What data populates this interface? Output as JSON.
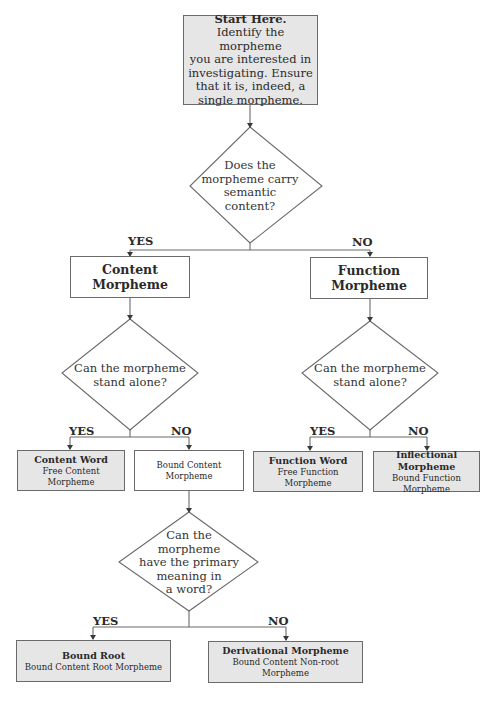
{
  "start": {
    "title": "Start Here.",
    "lines": [
      "Identify the morpheme",
      "you are interested in",
      "investigating. Ensure",
      "that it is, indeed, a",
      "single morpheme."
    ]
  },
  "q1": {
    "lines": [
      "Does the",
      "morpheme carry",
      "semantic",
      "content?"
    ],
    "yes_label": "YES",
    "no_label": "NO"
  },
  "content_morpheme": {
    "title": "Content Morpheme"
  },
  "function_morpheme": {
    "title": "Function Morpheme"
  },
  "q2_content": {
    "lines": [
      "Can the morpheme",
      "stand alone?"
    ],
    "yes_label": "YES",
    "no_label": "NO"
  },
  "q2_function": {
    "lines": [
      "Can the morpheme",
      "stand alone?"
    ],
    "yes_label": "YES",
    "no_label": "NO"
  },
  "content_word": {
    "title": "Content Word",
    "subtitle": "Free Content Morpheme"
  },
  "bound_content": {
    "subtitle": "Bound Content Morpheme"
  },
  "function_word": {
    "title": "Function Word",
    "subtitle": "Free Function Morpheme"
  },
  "inflectional": {
    "title": "Inflectional Morpheme",
    "subtitle": "Bound Function Morpheme"
  },
  "q3": {
    "lines": [
      "Can the",
      "morpheme",
      "have the primary",
      "meaning in",
      "a word?"
    ],
    "yes_label": "YES",
    "no_label": "NO"
  },
  "bound_root": {
    "title": "Bound Root",
    "subtitle": "Bound Content Root Morpheme"
  },
  "derivational": {
    "title": "Derivational Morpheme",
    "subtitle": "Bound Content Non-root Morpheme"
  },
  "colors": {
    "line": "#6a6a6a",
    "shaded_fill": "#e6e6e6",
    "text": "#2a2a2a"
  }
}
